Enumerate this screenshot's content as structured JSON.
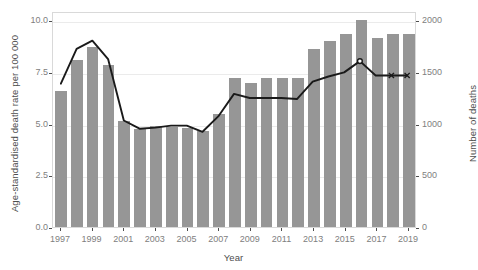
{
  "chart_data": {
    "type": "bar",
    "title": "",
    "xlabel": "Year",
    "ylabel": "Age-standardised death rate per 100 000",
    "ylabel_secondary": "Number of deaths",
    "grid": true,
    "legend_position": "none",
    "categories": [
      1997,
      1998,
      1999,
      2000,
      2001,
      2002,
      2003,
      2004,
      2005,
      2006,
      2007,
      2008,
      2009,
      2010,
      2011,
      2012,
      2013,
      2014,
      2015,
      2016,
      2017,
      2018,
      2019
    ],
    "xtick_labels": [
      "1997",
      "1999",
      "2001",
      "2003",
      "2005",
      "2007",
      "2009",
      "2011",
      "2013",
      "2015",
      "2017",
      "2019"
    ],
    "xtick_values": [
      1997,
      1999,
      2001,
      2003,
      2005,
      2007,
      2009,
      2011,
      2013,
      2015,
      2017,
      2019
    ],
    "ylim": [
      0,
      10.45
    ],
    "ytick_labels": [
      "0.0",
      "2.5",
      "5.0",
      "7.5",
      "10.0"
    ],
    "ytick_values": [
      0,
      2.5,
      5,
      7.5,
      10
    ],
    "ylim_secondary": [
      0,
      2090
    ],
    "ytick_labels_secondary": [
      "0",
      "500",
      "1000",
      "1500",
      "2000"
    ],
    "ytick_values_secondary": [
      0,
      500,
      1000,
      1500,
      2000
    ],
    "bar_color": "#969696",
    "line_color": "#1a1a1a",
    "series": [
      {
        "name": "Number of deaths",
        "type": "bar",
        "axis": "right",
        "values": [
          1320,
          1620,
          1740,
          1570,
          1030,
          950,
          975,
          965,
          960,
          930,
          1090,
          1440,
          1390,
          1440,
          1440,
          1440,
          1720,
          1800,
          1870,
          2000,
          1830,
          1870,
          1870
        ]
      },
      {
        "name": "Age-standardised death rate per 100 000",
        "type": "line",
        "axis": "left",
        "values": [
          7.0,
          8.7,
          9.1,
          8.2,
          5.2,
          4.8,
          4.85,
          4.95,
          4.95,
          4.65,
          5.4,
          6.5,
          6.3,
          6.3,
          6.3,
          6.25,
          7.1,
          7.35,
          7.55,
          8.1,
          7.4,
          7.4,
          7.4
        ],
        "markers": [
          {
            "x": 2016,
            "y": 8.1,
            "shape": "circle"
          },
          {
            "x": 2018,
            "y": 7.4,
            "shape": "x"
          },
          {
            "x": 2019,
            "y": 7.4,
            "shape": "x"
          }
        ]
      }
    ]
  }
}
